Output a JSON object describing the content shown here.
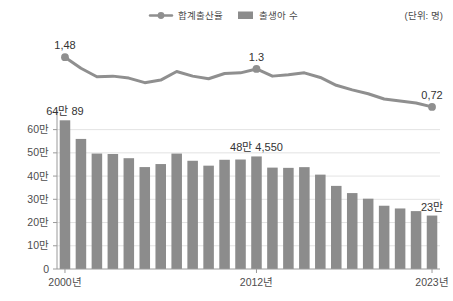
{
  "legend": {
    "position": "top-center",
    "items": [
      {
        "label": "합계출산율",
        "marker": "line-dot-icon",
        "color": "#8f8f8f"
      },
      {
        "label": "출생아 수",
        "marker": "bar-swatch-icon",
        "color": "#8c8c8c"
      }
    ]
  },
  "unit_note": "(단위: 명)",
  "chart_data": {
    "type": "bar",
    "title": "",
    "subtitle": "",
    "xlabel": "",
    "ylabel": "",
    "grid": true,
    "legend_position": "top-center",
    "categories": [
      "2000년",
      "2001년",
      "2002년",
      "2003년",
      "2004년",
      "2005년",
      "2006년",
      "2007년",
      "2008년",
      "2009년",
      "2010년",
      "2011년",
      "2012년",
      "2013년",
      "2014년",
      "2015년",
      "2016년",
      "2017년",
      "2018년",
      "2019년",
      "2020년",
      "2021년",
      "2022년",
      "2023년"
    ],
    "xtick_labels_shown": [
      "2000년",
      "2012년",
      "2023년"
    ],
    "ytick_labels": [
      "0",
      "10만",
      "20만",
      "30만",
      "40만",
      "50만",
      "60만"
    ],
    "ytick_values": [
      0,
      100000,
      200000,
      300000,
      400000,
      500000,
      600000
    ],
    "ylim": [
      0,
      650000
    ],
    "series": [
      {
        "name": "출생아 수",
        "type": "bar",
        "color": "#8c8c8c",
        "axis": "left",
        "values": [
          640089,
          559934,
          496911,
          495036,
          476958,
          438707,
          451759,
          496822,
          465892,
          444849,
          470171,
          471265,
          484550,
          436455,
          435435,
          438420,
          406243,
          357771,
          326822,
          302676,
          272337,
          260562,
          249186,
          230000
        ],
        "data_labels": [
          {
            "index": 0,
            "text": "64만 89"
          },
          {
            "index": 12,
            "text": "48만 4,550"
          },
          {
            "index": 23,
            "text": "23만"
          }
        ]
      },
      {
        "name": "합계출산율",
        "type": "line",
        "color": "#8f8f8f",
        "axis": "right",
        "values": [
          1.48,
          1.31,
          1.18,
          1.19,
          1.16,
          1.09,
          1.13,
          1.26,
          1.19,
          1.15,
          1.23,
          1.24,
          1.3,
          1.19,
          1.21,
          1.24,
          1.17,
          1.05,
          0.98,
          0.92,
          0.84,
          0.81,
          0.78,
          0.72
        ],
        "marker_points": [
          0,
          12,
          23
        ],
        "data_labels": [
          {
            "index": 0,
            "text": "1,48"
          },
          {
            "index": 12,
            "text": "1.3"
          },
          {
            "index": 23,
            "text": "0,72"
          }
        ]
      }
    ]
  },
  "colors": {
    "bar": "#8c8c8c",
    "line": "#8f8f8f",
    "grid": "#e3e3e3",
    "axis": "#9a9a9a",
    "text": "#4a4a4a",
    "background": "#ffffff"
  }
}
